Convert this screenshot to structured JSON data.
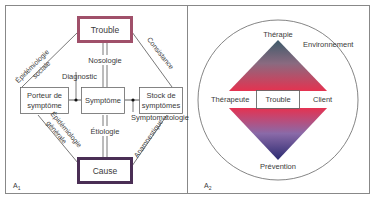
{
  "panel_a1": {
    "label": "A",
    "label_sub": "1",
    "nodes": {
      "trouble": "Trouble",
      "porteur_line1": "Porteur de",
      "porteur_line2": "symptôme",
      "symptome": "Symptôme",
      "stock_line1": "Stock de",
      "stock_line2": "symptômes",
      "cause": "Cause"
    },
    "edges": {
      "epidemiologie_sociale_1": "Épidémiologie",
      "epidemiologie_sociale_2": "sociale",
      "consistance": "Consistance",
      "nosologie": "Nosologie",
      "diagnostic": "Diagnostic",
      "etiologie": "Étiologie",
      "symptomatologie": "Symptomatologie",
      "epidemiologie_generale_1": "Épidémiologie",
      "epidemiologie_generale_2": "générale",
      "anamnestique": "Anamnestique"
    },
    "colors": {
      "trouble_border": "#a0506a",
      "cause_border": "#4a2e55"
    }
  },
  "panel_a2": {
    "label": "A",
    "label_sub": "2",
    "top": "Thérapie",
    "environment": "Environnement",
    "left": "Thérapeute",
    "center": "Trouble",
    "right": "Client",
    "bottom": "Prévention",
    "colors": {
      "top_apex": "#3d5a6a",
      "middle": "#e8304e",
      "bottom_apex": "#2a2a70"
    }
  }
}
